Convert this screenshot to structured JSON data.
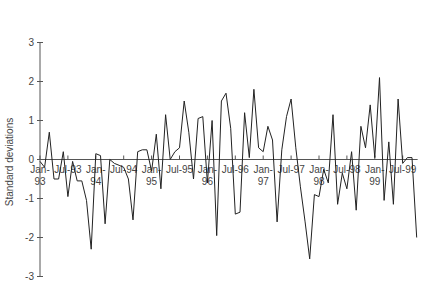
{
  "chart_data": {
    "type": "line",
    "title": "",
    "xlabel": "",
    "ylabel": "Standard deviations",
    "ylim": [
      -3,
      3
    ],
    "yticks": [
      3,
      2,
      1,
      0,
      -1,
      -2,
      -3
    ],
    "xtick_labels": [
      {
        "month_index": 0,
        "line1": "Jan-",
        "line2": "93"
      },
      {
        "month_index": 6,
        "line1": "Jul-93",
        "line2": ""
      },
      {
        "month_index": 12,
        "line1": "Jan-",
        "line2": "94"
      },
      {
        "month_index": 18,
        "line1": "Jul-94",
        "line2": ""
      },
      {
        "month_index": 24,
        "line1": "Jan-",
        "line2": "95"
      },
      {
        "month_index": 30,
        "line1": "Jul-95",
        "line2": ""
      },
      {
        "month_index": 36,
        "line1": "Jan-",
        "line2": "96"
      },
      {
        "month_index": 42,
        "line1": "Jul-96",
        "line2": ""
      },
      {
        "month_index": 48,
        "line1": "Jan-",
        "line2": "97"
      },
      {
        "month_index": 54,
        "line1": "Jul-97",
        "line2": ""
      },
      {
        "month_index": 60,
        "line1": "Jan-",
        "line2": "98"
      },
      {
        "month_index": 66,
        "line1": "Jul-98",
        "line2": ""
      },
      {
        "month_index": 72,
        "line1": "Jan-",
        "line2": "99"
      },
      {
        "month_index": 78,
        "line1": "Jul-99",
        "line2": ""
      }
    ],
    "grid": false,
    "legend": null,
    "series": [
      {
        "name": "Standard deviations",
        "color": "#222222",
        "start": "Jan-93",
        "frequency": "monthly",
        "values": [
          -0.05,
          -0.2,
          0.7,
          -0.5,
          -0.5,
          0.2,
          -0.95,
          -0.05,
          -0.55,
          -0.55,
          -1.05,
          -2.3,
          0.15,
          0.1,
          -1.65,
          0.0,
          -0.1,
          -0.15,
          -0.2,
          -0.5,
          -1.55,
          0.2,
          0.25,
          0.25,
          -0.3,
          0.65,
          -0.75,
          1.15,
          0.0,
          0.2,
          0.3,
          1.5,
          0.7,
          -0.5,
          1.05,
          1.1,
          -0.6,
          1.0,
          -1.95,
          1.5,
          1.7,
          0.8,
          -1.4,
          -1.35,
          1.2,
          0.05,
          1.8,
          0.3,
          0.2,
          0.85,
          0.5,
          -1.6,
          0.25,
          1.1,
          1.55,
          0.3,
          -0.7,
          -1.6,
          -2.55,
          -0.9,
          -0.95,
          -0.25,
          -0.6,
          1.15,
          -1.15,
          -0.35,
          -0.75,
          0.2,
          -1.3,
          0.85,
          0.3,
          1.4,
          0.05,
          2.1,
          -1.05,
          0.45,
          -1.15,
          1.55,
          -0.1,
          0.05,
          0.05,
          -2.0
        ]
      }
    ]
  }
}
